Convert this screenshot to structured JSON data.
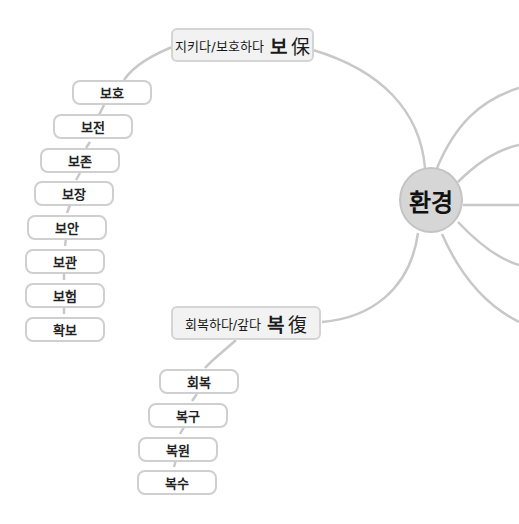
{
  "center": {
    "label": "환경"
  },
  "branches": [
    {
      "label": "지키다/보호하다",
      "char": "보",
      "hanja": "保",
      "children": [
        "보호",
        "보전",
        "보존",
        "보장",
        "보안",
        "보관",
        "보험",
        "확보"
      ]
    },
    {
      "label": "회복하다/갚다",
      "char": "복",
      "hanja": "復",
      "children": [
        "회복",
        "복구",
        "복원",
        "복수"
      ]
    }
  ],
  "colors": {
    "line": "#c8c8c8",
    "center_fill": "#d6d6d6",
    "branch_fill": "#f2f2f2",
    "leaf_border": "#cfcfcf"
  }
}
